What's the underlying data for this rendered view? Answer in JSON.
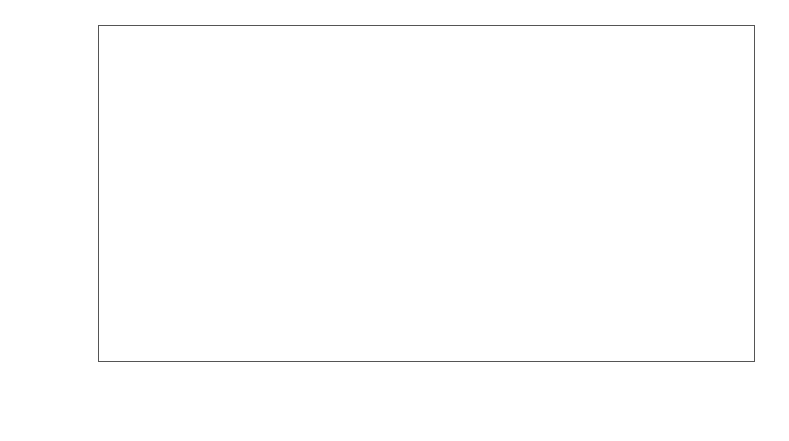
{
  "figure": {
    "background_color": "#ffffff",
    "panel_border_color": "#555555",
    "grid_color": "#ececec"
  },
  "axes": {
    "x_title": "dens",
    "y_title": "sqrt(hardness)",
    "x_ticks": [
      "30",
      "40",
      "50",
      "60",
      "70"
    ],
    "y_ticks": [
      "20",
      "30",
      "40",
      "50"
    ]
  },
  "chart_data": {
    "type": "scatter",
    "title": "",
    "xlabel": "dens",
    "ylabel": "sqrt(hardness)",
    "xlim": [
      24.0,
      72.8
    ],
    "ylim": [
      19.0,
      60.1
    ],
    "xticks": [
      30,
      40,
      50,
      60,
      70
    ],
    "yticks": [
      20,
      30,
      40,
      50
    ],
    "grid": true,
    "legend": null,
    "point_color": "#111111",
    "point_size": 9,
    "series": [
      {
        "name": "observations",
        "x": [
          24.7,
          24.7,
          27.3,
          28.4,
          28.6,
          29.7,
          30.7,
          32.7,
          35.6,
          38.5,
          38.8,
          39.3,
          39.4,
          39.9,
          40.3,
          40.3,
          40.6,
          41.0,
          41.4,
          42.9,
          45.8,
          46.9,
          48.2,
          51.5,
          51.5,
          53.4,
          56.0,
          56.5,
          57.3,
          57.5,
          58.8,
          59.2,
          59.8,
          66.0,
          67.4,
          68.8,
          69.1,
          69.1
        ],
        "y": [
          22.0,
          20.6,
          20.2,
          25.5,
          22.4,
          24.1,
          24.1,
          26.4,
          31.2,
          32.4,
          30.2,
          32.9,
          30.5,
          33.8,
          33.8,
          31.5,
          31.5,
          34.2,
          33.0,
          35.5,
          34.2,
          41.8,
          37.3,
          44.7,
          41.2,
          43.2,
          42.4,
          44.3,
          44.5,
          44.0,
          47.8,
          44.8,
          43.8,
          57.0,
          51.5,
          52.0,
          55.6,
          53.9
        ]
      }
    ],
    "fit_line": {
      "type": "linear_regression_with_confidence_band",
      "line_color": "#4a4a4a",
      "band_color": "#d8d8d8",
      "slope": 0.7565,
      "intercept": 3.35,
      "x_start": 24.7,
      "x_end": 69.1,
      "band_half_width_center": 0.45,
      "band_half_width_ends": 1.25
    }
  }
}
